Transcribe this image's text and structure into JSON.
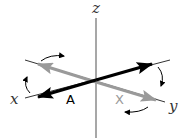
{
  "diagram": {
    "axes": {
      "z": {
        "label": "z",
        "color": "#8a8a8a"
      },
      "x": {
        "label": "x",
        "color": "#333333"
      },
      "y": {
        "label": "y",
        "color": "#333333"
      }
    },
    "vectors": {
      "A": {
        "label": "A",
        "color": "#000000"
      },
      "X": {
        "label": "X",
        "color": "#9a9a9a"
      }
    },
    "rotation_arrows": [
      {
        "name": "rotation-arrow-top-left",
        "color": "#000000"
      },
      {
        "name": "rotation-arrow-left",
        "color": "#000000"
      },
      {
        "name": "rotation-arrow-right",
        "color": "#000000"
      },
      {
        "name": "rotation-arrow-bottom",
        "color": "#000000"
      }
    ]
  }
}
